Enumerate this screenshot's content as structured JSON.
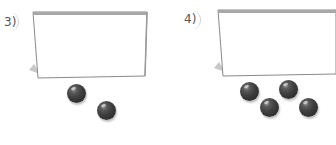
{
  "problems": [
    {
      "number": "3)",
      "ball_count": 2,
      "box_label": ""
    },
    {
      "number": "4)",
      "ball_count": 4,
      "box_label": ""
    }
  ],
  "colors": {
    "ball": "#3a3a3a",
    "box_border": "#8a8a8a",
    "box_top": "#a8a8a8",
    "label": "#555555"
  }
}
